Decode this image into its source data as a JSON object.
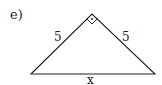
{
  "problem_label": "e)",
  "triangle": {
    "left_side": "5",
    "right_side": "5",
    "base": "x",
    "right_angle_marker": "right-angle-with-dot"
  },
  "colors": {
    "stroke": "#222222",
    "background": "#ffffff"
  }
}
